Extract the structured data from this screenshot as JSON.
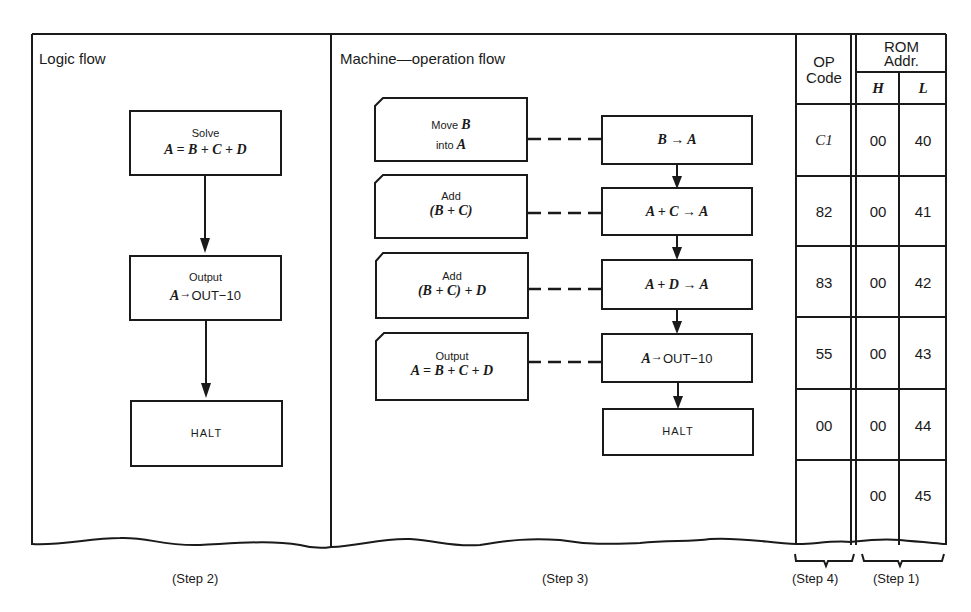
{
  "panels": {
    "logic": {
      "title": "Logic flow",
      "step": "(Step 2)"
    },
    "machine": {
      "title": "Machine—operation flow",
      "step": "(Step 3)"
    },
    "opcode": {
      "header_line1": "OP",
      "header_line2": "Code",
      "step": "(Step 4)"
    },
    "rom": {
      "header_line1": "ROM",
      "header_line2": "Addr.",
      "col_h": "H",
      "col_l": "L",
      "step": "(Step 1)"
    }
  },
  "logic_flow": [
    {
      "label": "Solve",
      "expr": "A = B + C + D"
    },
    {
      "label": "Output",
      "expr_var": "A",
      "expr_arrow": "→",
      "expr_rest": "OUT−10"
    },
    {
      "label": "HALT"
    }
  ],
  "machine_flow": {
    "descriptions": [
      {
        "line1_text": "Move ",
        "line1_var": "B",
        "line2_text": "into ",
        "line2_var": "A"
      },
      {
        "line1": "Add",
        "line2": "(B + C)"
      },
      {
        "line1": "Add",
        "line2": "(B + C) + D"
      },
      {
        "line1": "Output",
        "line2": "A = B + C + D"
      }
    ],
    "operations": [
      {
        "expr": "B → A"
      },
      {
        "expr": "A + C → A"
      },
      {
        "expr": "A + D → A"
      },
      {
        "expr_var": "A",
        "expr_arrow": "→",
        "expr_rest": "OUT−10"
      },
      {
        "expr": "HALT"
      }
    ]
  },
  "table": {
    "rows": [
      {
        "op": "C1",
        "h": "00",
        "l": "40"
      },
      {
        "op": "82",
        "h": "00",
        "l": "41"
      },
      {
        "op": "83",
        "h": "00",
        "l": "42"
      },
      {
        "op": "55",
        "h": "00",
        "l": "43"
      },
      {
        "op": "00",
        "h": "00",
        "l": "44"
      },
      {
        "op": "",
        "h": "00",
        "l": "45"
      }
    ]
  }
}
